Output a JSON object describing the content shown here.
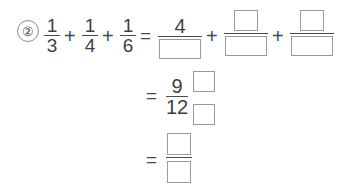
{
  "document": {
    "kind": "math-worksheet-problem",
    "item_number": "②",
    "background_color": "#ffffff",
    "ink_color": "#3f3f3f",
    "box_border_color": "#9a9a9a"
  },
  "problem": {
    "line1": {
      "terms": [
        {
          "numerator": "1",
          "denominator": "3"
        },
        {
          "numerator": "1",
          "denominator": "4"
        },
        {
          "numerator": "1",
          "denominator": "6"
        }
      ],
      "operators": [
        "+",
        "+"
      ],
      "equals": "=",
      "result_terms": [
        {
          "numerator": "4",
          "numerator_is_box": false,
          "denominator": "",
          "denominator_is_box": true
        },
        {
          "numerator": "",
          "numerator_is_box": true,
          "denominator": "",
          "denominator_is_box": true
        },
        {
          "numerator": "",
          "numerator_is_box": true,
          "denominator": "",
          "denominator_is_box": true
        }
      ],
      "result_operators": [
        "+",
        "+"
      ]
    },
    "line2": {
      "equals": "=",
      "fraction": {
        "numerator": "9",
        "denominator": "12"
      },
      "blank_box_top": "",
      "blank_box_bottom": ""
    },
    "line3": {
      "equals": "=",
      "fraction": {
        "numerator": "",
        "numerator_is_box": true,
        "denominator": "",
        "denominator_is_box": true
      }
    }
  }
}
